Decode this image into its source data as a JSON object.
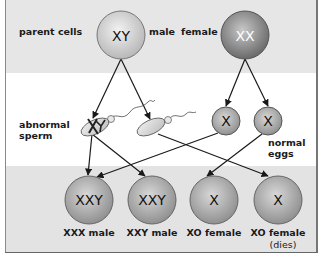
{
  "diagram": {
    "colors": {
      "band_gray": "#e6e6e6",
      "band_white": "#ffffff",
      "cell_fill_light": "#c9c9c9",
      "cell_fill_dark": "#7e7e7e",
      "line": "#1a1a1a"
    },
    "rows": {
      "parent_label": "parent cells",
      "gametes_left_label_line1": "abnormal",
      "gametes_left_label_line2": "sperm",
      "gametes_right_label_line1": "normal",
      "gametes_right_label_line2": "eggs"
    },
    "parents": [
      {
        "id": "male",
        "genotype": "XY",
        "label": "male"
      },
      {
        "id": "female",
        "genotype": "XX",
        "label": "female"
      }
    ],
    "gametes": [
      {
        "id": "sperm-xy",
        "type": "sperm",
        "chromosomes": "XY"
      },
      {
        "id": "sperm-o",
        "type": "sperm",
        "chromosomes": "O"
      },
      {
        "id": "egg-1",
        "type": "egg",
        "chromosomes": "X"
      },
      {
        "id": "egg-2",
        "type": "egg",
        "chromosomes": "X"
      }
    ],
    "offspring": [
      {
        "genotype": "XXY",
        "label": "XXX male",
        "note": ""
      },
      {
        "genotype": "XXY",
        "label": "XXY male",
        "note": ""
      },
      {
        "genotype": "X",
        "label": "XO female",
        "note": ""
      },
      {
        "genotype": "X",
        "label": "XO female",
        "note": "(dies)"
      }
    ],
    "arrows": [
      {
        "from": "male",
        "to": "sperm-xy"
      },
      {
        "from": "male",
        "to": "sperm-o"
      },
      {
        "from": "female",
        "to": "egg-1"
      },
      {
        "from": "female",
        "to": "egg-2"
      },
      {
        "from": "sperm-xy",
        "to": "offspring-1"
      },
      {
        "from": "sperm-xy",
        "to": "offspring-2"
      },
      {
        "from": "sperm-o",
        "to": "offspring-4"
      },
      {
        "from": "egg-1",
        "to": "offspring-1"
      },
      {
        "from": "egg-2",
        "to": "offspring-3"
      }
    ]
  }
}
